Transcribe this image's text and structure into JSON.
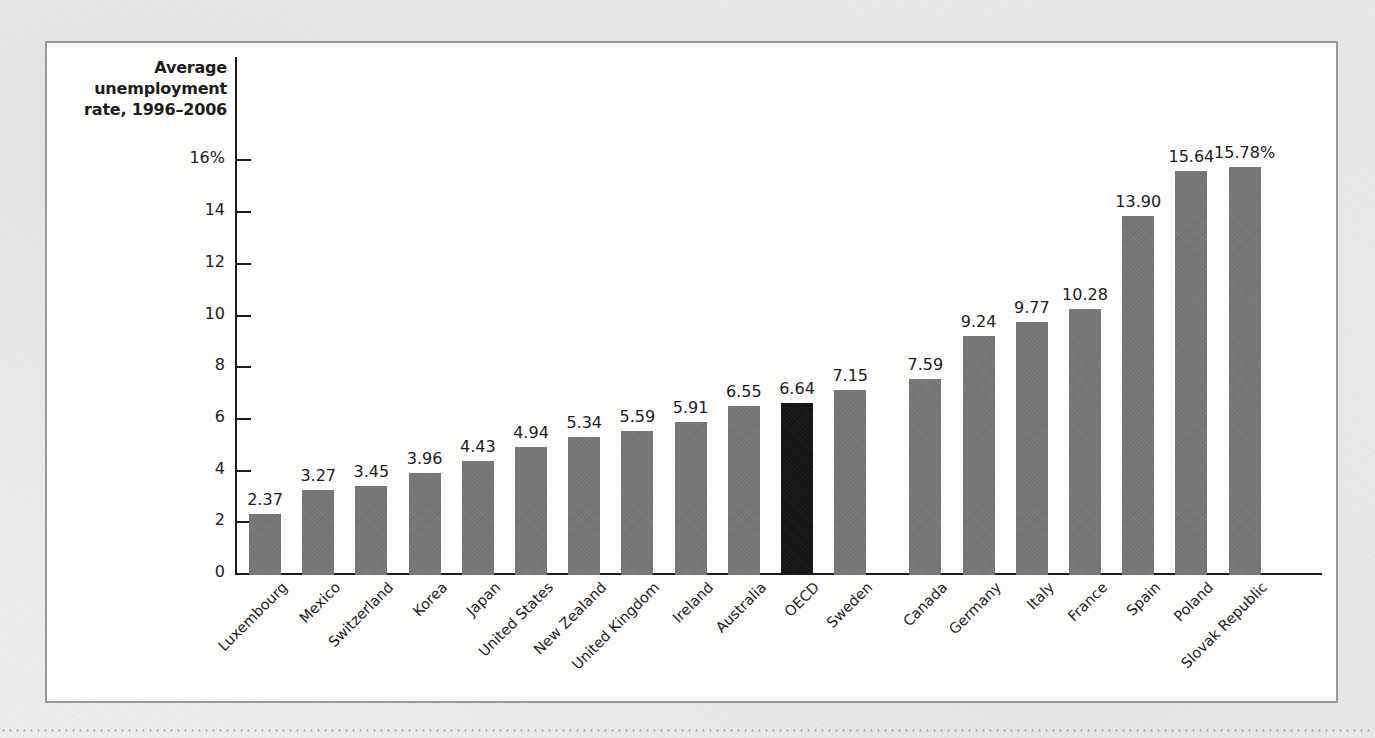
{
  "figure": {
    "axis_title": "Average\nunemployment\nrate, 1996–2006",
    "bar_color": "#777776",
    "highlight_color": "#151515",
    "highlight_category": "OECD"
  },
  "chart_data": {
    "type": "bar",
    "title": "",
    "subtitle": "",
    "xlabel": "",
    "ylabel": "Average unemployment rate, 1996–2006",
    "ylim": [
      0,
      17
    ],
    "grid": false,
    "legend": "none",
    "y_ticks": [
      "0",
      "2",
      "4",
      "6",
      "8",
      "10",
      "12",
      "14",
      "16%"
    ],
    "y_tick_values": [
      0,
      2,
      4,
      6,
      8,
      10,
      12,
      14,
      16
    ],
    "categories": [
      "Luxembourg",
      "Mexico",
      "Switzerland",
      "Korea",
      "Japan",
      "United States",
      "New Zealand",
      "United Kingdom",
      "Ireland",
      "Australia",
      "OECD",
      "Sweden",
      "Canada",
      "Germany",
      "Italy",
      "France",
      "Spain",
      "Poland",
      "Slovak Republic"
    ],
    "values": [
      2.37,
      3.27,
      3.45,
      3.96,
      4.43,
      4.94,
      5.34,
      5.59,
      5.91,
      6.55,
      6.64,
      7.15,
      7.59,
      9.24,
      9.77,
      10.28,
      13.9,
      15.64,
      15.78
    ],
    "value_labels": [
      "2.37",
      "3.27",
      "3.45",
      "3.96",
      "4.43",
      "4.94",
      "5.34",
      "5.59",
      "5.91",
      "6.55",
      "6.64",
      "7.15",
      "7.59",
      "9.24",
      "9.77",
      "10.28",
      "13.90",
      "15.64",
      "15.78%"
    ],
    "highlight_index": 10
  }
}
